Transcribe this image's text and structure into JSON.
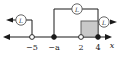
{
  "figure": {
    "kind": "number-line-diagram",
    "axis": {
      "name": "x",
      "ticks": [
        {
          "label": "−5",
          "endpoint": "open"
        },
        {
          "label": "−a",
          "endpoint": "filled"
        },
        {
          "label": "2",
          "endpoint": "open"
        },
        {
          "label": "4",
          "endpoint": "filled"
        }
      ]
    },
    "branches": [
      {
        "id": "left-ray",
        "badge": "L",
        "direction": "left"
      },
      {
        "id": "middle-bracket",
        "badge": "L",
        "direction": "none"
      },
      {
        "id": "right-ray",
        "badge": "L",
        "direction": "right"
      }
    ],
    "region": {
      "label": "shaded-interval",
      "from": "2",
      "to": "4",
      "fill_color": "#c9c9c9"
    },
    "colors": {
      "ink": "#1a1a1a",
      "shade": "#c9c9c9",
      "badge_stroke": "#555555"
    }
  }
}
